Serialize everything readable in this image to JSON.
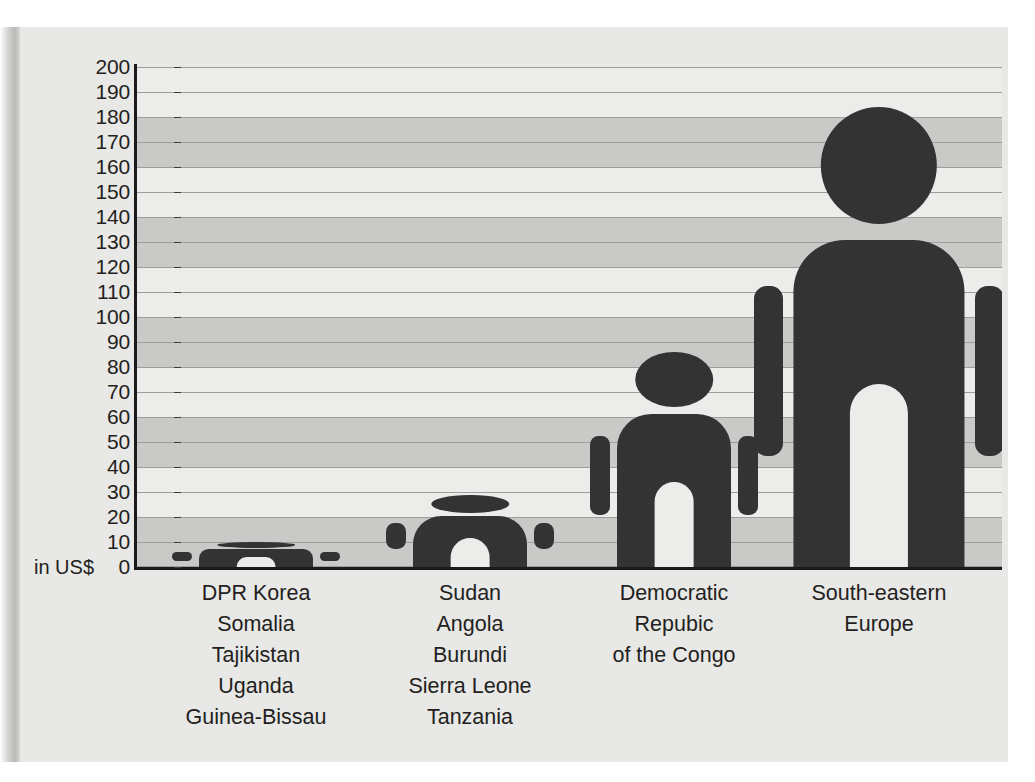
{
  "axis": {
    "unit_label": "in US$",
    "y_ticks": [
      200,
      190,
      180,
      170,
      160,
      150,
      140,
      130,
      120,
      110,
      100,
      90,
      80,
      70,
      60,
      50,
      40,
      30,
      20,
      10,
      0
    ]
  },
  "colors": {
    "figure": "#333333",
    "band_dark": "#c9c9c7",
    "band_light": "#ececea",
    "gridline": "#9d9d9b",
    "axis": "#1a1a1a",
    "paper": "#e8e8e6",
    "text": "#231f20"
  },
  "categories": [
    {
      "id": "group-1",
      "lines": [
        "DPR Korea",
        "Somalia",
        "Tajikistan",
        "Uganda",
        "Guinea-Bissau"
      ]
    },
    {
      "id": "group-2",
      "lines": [
        "Sudan",
        "Angola",
        "Burundi",
        "Sierra Leone",
        "Tanzania"
      ]
    },
    {
      "id": "group-3",
      "lines": [
        "Democratic",
        "Repubic",
        "of the Congo"
      ]
    },
    {
      "id": "group-4",
      "lines": [
        "South-eastern",
        "Europe"
      ]
    }
  ],
  "chart_data": {
    "type": "bar",
    "title": "",
    "xlabel": "",
    "ylabel": "in US$",
    "ylim": [
      0,
      200
    ],
    "ytick_step": 10,
    "grid": true,
    "legend": "none",
    "note": "Pictogram bar chart: each category drawn as a human figure whose total height encodes the value.",
    "categories": [
      "DPR Korea / Somalia / Tajikistan / Uganda / Guinea-Bissau",
      "Sudan / Angola / Burundi / Sierra Leone / Tanzania",
      "Democratic Repubic of the Congo",
      "South-eastern Europe"
    ],
    "values": [
      10,
      29,
      86,
      184
    ]
  }
}
